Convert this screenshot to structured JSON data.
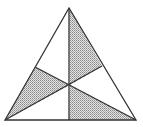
{
  "diagram": {
    "type": "triangle-medians",
    "vertices": {
      "apex": [
        69,
        8
      ],
      "bottom_left": [
        5,
        120
      ],
      "bottom_right": [
        136,
        120
      ]
    },
    "midpoints": {
      "left_side": [
        35,
        67
      ],
      "right_side": [
        102,
        66
      ],
      "base": [
        69,
        120
      ]
    },
    "centroid": [
      70,
      85
    ],
    "shaded_regions": [
      "apex-centroid-right_midpoint",
      "left_midpoint-centroid-bottom_left",
      "base_midpoint-centroid-bottom_right"
    ],
    "colors": {
      "stroke": "#333333",
      "shade": "#bdbdbd",
      "background": "#ffffff"
    }
  }
}
